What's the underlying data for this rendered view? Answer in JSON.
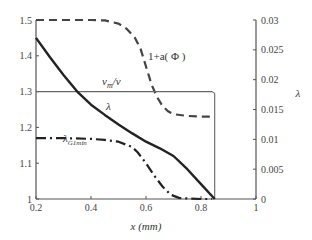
{
  "chart_data": {
    "type": "line",
    "title": "",
    "xlabel": "x (mm)",
    "ylabel_left": "",
    "ylabel_right": "λ",
    "xlim": [
      0.2,
      1.0
    ],
    "ylim_left": [
      1.0,
      1.5
    ],
    "ylim_right": [
      0.0,
      0.03
    ],
    "grid": false,
    "x_ticks": [
      "0.2",
      "0.4",
      "0.6",
      "0.8",
      "1"
    ],
    "y_left_ticks": [
      "1",
      "1.1",
      "1.2",
      "1.3",
      "1.4",
      "1.5"
    ],
    "y_right_ticks": [
      "0",
      "0.005",
      "0.01",
      "0.015",
      "0.02",
      "0.025",
      "0.03"
    ],
    "series": [
      {
        "name": "1+a(Φ)",
        "style": "dashed",
        "axis": "left",
        "x": [
          0.2,
          0.3,
          0.4,
          0.45,
          0.5,
          0.53,
          0.56,
          0.58,
          0.6,
          0.62,
          0.64,
          0.66,
          0.68,
          0.7,
          0.75,
          0.8,
          0.85
        ],
        "values": [
          1.5,
          1.5,
          1.5,
          1.499,
          1.49,
          1.475,
          1.45,
          1.42,
          1.37,
          1.32,
          1.285,
          1.26,
          1.245,
          1.237,
          1.232,
          1.23,
          1.23
        ]
      },
      {
        "name": "v_m/v",
        "style": "solid-thin",
        "axis": "left",
        "x": [
          0.2,
          0.4,
          0.6,
          0.8,
          0.84,
          0.85,
          0.85
        ],
        "values": [
          1.3,
          1.3,
          1.3,
          1.3,
          1.3,
          1.295,
          1.0
        ]
      },
      {
        "name": "λ",
        "style": "solid-thick",
        "axis": "right",
        "x": [
          0.2,
          0.25,
          0.3,
          0.35,
          0.4,
          0.45,
          0.5,
          0.55,
          0.6,
          0.65,
          0.7,
          0.75,
          0.8,
          0.85
        ],
        "values": [
          0.027,
          0.0238,
          0.0208,
          0.018,
          0.0158,
          0.0141,
          0.0125,
          0.011,
          0.0096,
          0.0085,
          0.0072,
          0.005,
          0.0025,
          0.0
        ]
      },
      {
        "name": "λ_G1min",
        "style": "dash-dot",
        "axis": "left",
        "x": [
          0.2,
          0.3,
          0.4,
          0.45,
          0.5,
          0.55,
          0.57,
          0.6,
          0.63,
          0.66,
          0.69,
          0.72,
          0.76,
          0.8,
          0.84
        ],
        "values": [
          1.17,
          1.17,
          1.168,
          1.165,
          1.16,
          1.145,
          1.13,
          1.1,
          1.065,
          1.035,
          1.012,
          1.003,
          1.001,
          1.0,
          1.0
        ]
      }
    ],
    "annotations": [
      {
        "text": "1+a( Φ )",
        "x": 0.63,
        "y": 1.44
      },
      {
        "text": "v_m/v",
        "x": 0.5,
        "y": 1.315
      },
      {
        "text": "λ",
        "x": 0.5,
        "y": 1.265
      },
      {
        "text": "λ_G1min",
        "x": 0.39,
        "y": 1.19
      }
    ]
  },
  "labels": {
    "x_axis": "x (mm)",
    "right_axis": "λ",
    "curve_alpha": "1+a( Φ )",
    "curve_vm_main": "v",
    "curve_vm_sub": "m",
    "curve_vm_tail": "/v",
    "curve_lambda": "λ",
    "curve_lg_main": "λ",
    "curve_lg_sub": "G1min"
  }
}
